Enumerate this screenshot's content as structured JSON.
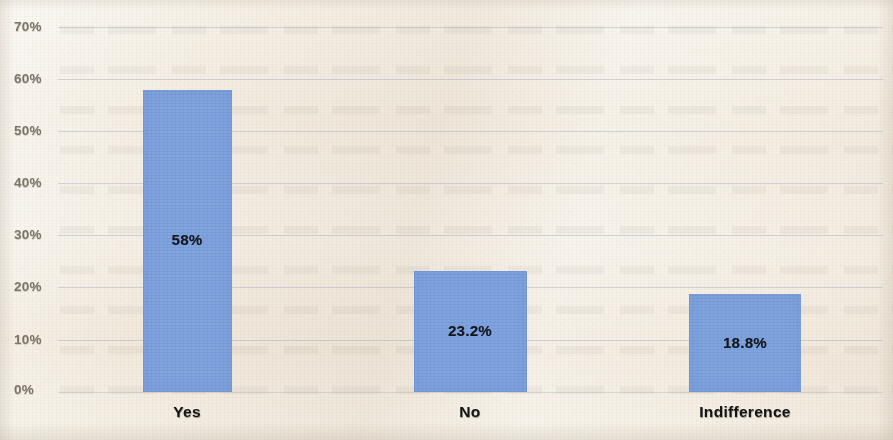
{
  "chart_data": {
    "type": "bar",
    "title": "",
    "subtitle": "",
    "xlabel": "",
    "ylabel": "",
    "categories": [
      "Yes",
      "No",
      "Indifference"
    ],
    "values": [
      58,
      23.2,
      18.8
    ],
    "data_labels": [
      "58%",
      "23.2%",
      "18.8%"
    ],
    "ylim": [
      0,
      70
    ],
    "ytick_values": [
      0,
      10,
      20,
      30,
      40,
      50,
      60,
      70
    ],
    "ytick_labels": [
      "0%",
      "10%",
      "20%",
      "30%",
      "40%",
      "50%",
      "60%",
      "70%"
    ],
    "grid": true,
    "legend": false,
    "legend_position": "none",
    "series": [
      {
        "name": "Response share",
        "values": [
          58,
          23.2,
          18.8
        ]
      }
    ]
  },
  "style": {
    "bar_color": "#80a4de",
    "background_color": "#f4eee4",
    "gridline_color": "#96a6c4",
    "ytick_color": "#7c756a",
    "label_color": "#141414"
  }
}
